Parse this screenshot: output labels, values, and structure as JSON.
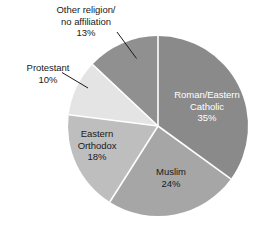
{
  "chart_data": {
    "type": "pie",
    "title": "",
    "subtitle": "",
    "xlabel": "",
    "ylabel": "",
    "legend_position": "none",
    "grid": false,
    "total_percent": 100,
    "start_angle_deg": 0,
    "direction": "clockwise",
    "categories": [
      "Roman/Eastern Catholic",
      "Muslim",
      "Eastern Orthodox",
      "Protestant",
      "Other religion/no affiliation"
    ],
    "values": [
      35,
      24,
      18,
      10,
      13
    ],
    "value_unit": "%",
    "slices": [
      {
        "name": "Roman/Eastern Catholic",
        "label_line1": "Roman/Eastern",
        "label_line2": "Catholic",
        "value": 35,
        "value_label": "35%",
        "color": "#8a8a8a",
        "label_placement": "inside",
        "text_color": "#ffffff"
      },
      {
        "name": "Muslim",
        "label_line1": "Muslim",
        "label_line2": "",
        "value": 24,
        "value_label": "24%",
        "color": "#a6a6a6",
        "label_placement": "inside",
        "text_color": "#1a1a1a"
      },
      {
        "name": "Eastern Orthodox",
        "label_line1": "Eastern",
        "label_line2": "Orthodox",
        "value": 18,
        "value_label": "18%",
        "color": "#bebebe",
        "label_placement": "inside",
        "text_color": "#1a1a1a"
      },
      {
        "name": "Protestant",
        "label_line1": "Protestant",
        "label_line2": "",
        "value": 10,
        "value_label": "10%",
        "color": "#e4e4e4",
        "label_placement": "outside",
        "text_color": "#1a1a1a"
      },
      {
        "name": "Other religion/no affiliation",
        "label_line1": "Other religion/",
        "label_line2": "no affiliation",
        "value": 13,
        "value_label": "13%",
        "color": "#909090",
        "label_placement": "outside",
        "text_color": "#1a1a1a"
      }
    ],
    "separator_color": "#ffffff",
    "leader_line_color": "#1a1a1a",
    "background_color": "#ffffff"
  },
  "labels": {
    "other": "Other religion/\nno affiliation\n13%",
    "protestant": "Protestant\n10%",
    "catholic": "Roman/Eastern\nCatholic\n35%",
    "muslim": "Muslim\n24%",
    "orthodox": "Eastern\nOrthodox\n18%"
  }
}
